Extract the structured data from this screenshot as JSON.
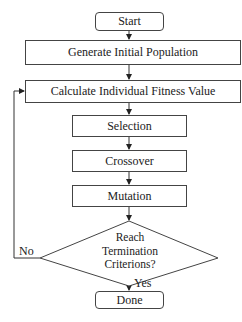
{
  "diagram": {
    "type": "flowchart",
    "nodes": [
      {
        "id": "start",
        "shape": "terminal",
        "label": "Start"
      },
      {
        "id": "generate",
        "shape": "process",
        "label": "Generate Initial Population"
      },
      {
        "id": "calculate",
        "shape": "process",
        "label": "Calculate Individual Fitness Value"
      },
      {
        "id": "selection",
        "shape": "process",
        "label": "Selection"
      },
      {
        "id": "crossover",
        "shape": "process",
        "label": "Crossover"
      },
      {
        "id": "mutation",
        "shape": "process",
        "label": "Mutation"
      },
      {
        "id": "decision",
        "shape": "decision",
        "label": "Reach Termination Criterions?",
        "lines": [
          "Reach",
          "Termination",
          "Criterions?"
        ]
      },
      {
        "id": "done",
        "shape": "terminal",
        "label": "Done"
      }
    ],
    "edges": [
      {
        "from": "start",
        "to": "generate",
        "label": ""
      },
      {
        "from": "generate",
        "to": "calculate",
        "label": ""
      },
      {
        "from": "calculate",
        "to": "selection",
        "label": ""
      },
      {
        "from": "selection",
        "to": "crossover",
        "label": ""
      },
      {
        "from": "crossover",
        "to": "mutation",
        "label": ""
      },
      {
        "from": "mutation",
        "to": "decision",
        "label": ""
      },
      {
        "from": "decision",
        "to": "done",
        "label": "Yes"
      },
      {
        "from": "decision",
        "to": "calculate",
        "label": "No"
      }
    ],
    "labels": {
      "yes": "Yes",
      "no": "No"
    }
  }
}
